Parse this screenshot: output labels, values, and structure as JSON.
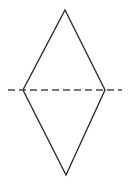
{
  "figure": {
    "background_color": "#ffffff",
    "width": 130,
    "height": 185
  },
  "chart_data": {
    "type": "diagram",
    "shape": "rhombus",
    "title": "",
    "stroke_color": "#2b2b2b",
    "dash_color": "#4a4a4a",
    "vertices": [
      {
        "name": "top",
        "x": 65,
        "y": 10
      },
      {
        "name": "right",
        "x": 105,
        "y": 90
      },
      {
        "name": "bottom",
        "x": 66,
        "y": 175
      },
      {
        "name": "left",
        "x": 23,
        "y": 90
      }
    ],
    "outline_path": "M 65 10 L 105 90 L 66 175 L 23 90 Z",
    "diagonal": {
      "name": "horizontal-diagonal",
      "style": "dashed",
      "x1": 8,
      "y1": 90,
      "x2": 122,
      "y2": 90,
      "dash_length": 7,
      "gap_length": 4
    },
    "labels": [],
    "annotations": []
  }
}
